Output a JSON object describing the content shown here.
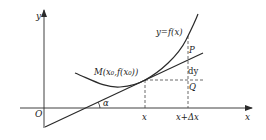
{
  "diagram": {
    "colors": {
      "stroke": "#2a2a2a",
      "dashed": "#444444",
      "background": "#ffffff"
    },
    "axes": {
      "x_label": "x",
      "y_label": "y",
      "origin_label": "O"
    },
    "curve": {
      "label": "y=f(x)"
    },
    "tangent": {
      "angle_label": "α"
    },
    "points": {
      "M": {
        "label": "M(x₀,f(x₀))"
      },
      "P": {
        "label": "P"
      },
      "Q": {
        "label": "Q"
      }
    },
    "segment_labels": {
      "dy": "dy"
    },
    "x_ticks": {
      "x": "x",
      "x_plus_dx": "x+Δx"
    }
  }
}
